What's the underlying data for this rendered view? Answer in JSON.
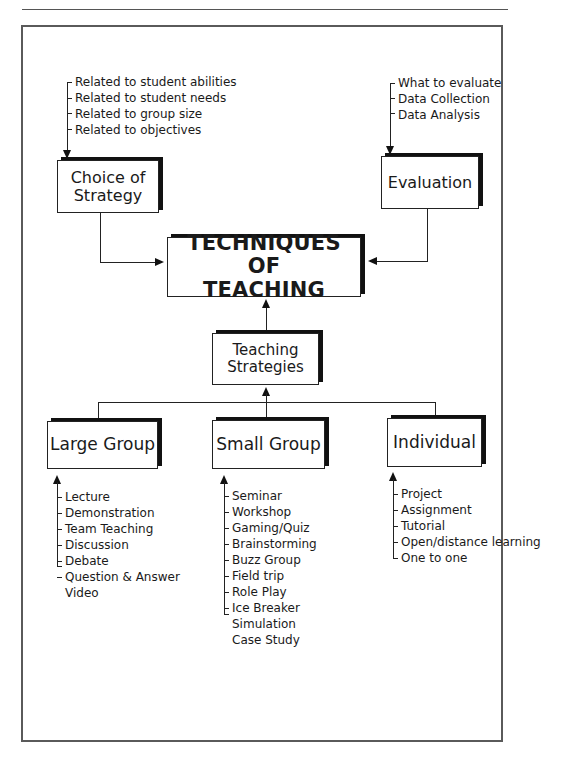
{
  "diagram": {
    "title": "TECHNIQUES OF TEACHING",
    "title_lines": [
      "TECHNIQUES OF",
      "TEACHING"
    ],
    "nodes": {
      "choice_of_strategy": {
        "lines": [
          "Choice of",
          "Strategy"
        ],
        "factors": [
          "Related to student abilities",
          "Related to student needs",
          "Related to group size",
          "Related to objectives"
        ]
      },
      "evaluation": {
        "lines": [
          "Evaluation"
        ],
        "factors": [
          "What to evaluate",
          "Data Collection",
          "Data Analysis"
        ]
      },
      "teaching_strategies": {
        "lines": [
          "Teaching",
          "Strategies"
        ]
      },
      "large_group": {
        "label": "Large Group",
        "items": [
          "Lecture",
          "Demonstration",
          "Team Teaching",
          "Discussion",
          "Debate",
          "Question & Answer",
          "Video"
        ]
      },
      "small_group": {
        "label": "Small Group",
        "items": [
          "Seminar",
          "Workshop",
          "Gaming/Quiz",
          "Brainstorming",
          "Buzz Group",
          "Field trip",
          "Role Play",
          "Ice Breaker",
          "Simulation",
          "Case Study"
        ]
      },
      "individual": {
        "label": "Individual",
        "items": [
          "Project",
          "Assignment",
          "Tutorial",
          "Open/distance learning",
          "One to one"
        ]
      }
    },
    "edges": [
      {
        "from": "choice_of_strategy",
        "to": "techniques_of_teaching"
      },
      {
        "from": "evaluation",
        "to": "techniques_of_teaching"
      },
      {
        "from": "teaching_strategies",
        "to": "techniques_of_teaching"
      },
      {
        "from": "large_group",
        "to": "teaching_strategies"
      },
      {
        "from": "small_group",
        "to": "teaching_strategies"
      },
      {
        "from": "individual",
        "to": "teaching_strategies"
      }
    ],
    "colors": {
      "ink": "#1a1a1a",
      "frame": "#5a5a5a",
      "background": "#ffffff"
    }
  }
}
